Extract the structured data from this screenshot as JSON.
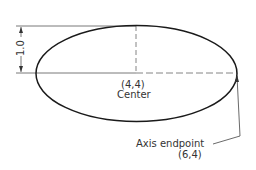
{
  "diagram": {
    "dimension_label": "1.0",
    "center": {
      "coords": "(4,4)",
      "label": "Center"
    },
    "axis_endpoint": {
      "label": "Axis endpoint",
      "coords": "(6,4)"
    },
    "colors": {
      "stroke": "#1a1a1a",
      "dim": "#555555",
      "text": "#333333"
    }
  }
}
